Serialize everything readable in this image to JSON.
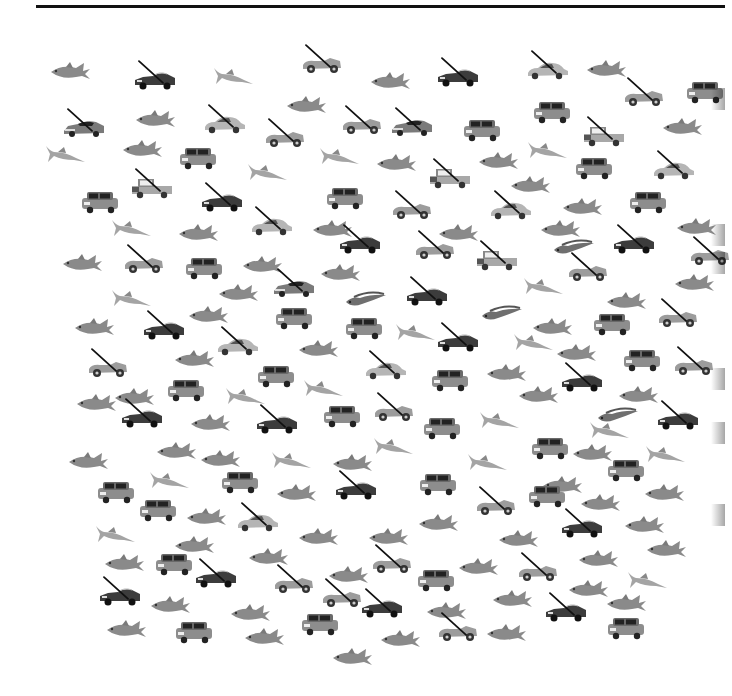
{
  "colors": {
    "rule": "#111111",
    "cross": "#111111",
    "fish": "#8a8a8a",
    "car_dark": "#3a3a3a",
    "car_light": "#9a9a9a"
  },
  "legend": {
    "target": "non-mini car (crossed)",
    "distractors": [
      "mini car",
      "fish"
    ]
  },
  "items": [
    {
      "t": "fish",
      "x": 48,
      "y": 60
    },
    {
      "t": "convertible",
      "x": 133,
      "y": 68,
      "c": 1
    },
    {
      "t": "marlin",
      "x": 210,
      "y": 64
    },
    {
      "t": "roadster",
      "x": 300,
      "y": 52,
      "c": 1
    },
    {
      "t": "fish",
      "x": 368,
      "y": 70
    },
    {
      "t": "convertible",
      "x": 436,
      "y": 65,
      "c": 1
    },
    {
      "t": "coupe",
      "x": 526,
      "y": 58,
      "c": 1
    },
    {
      "t": "fish",
      "x": 584,
      "y": 58
    },
    {
      "t": "roadster",
      "x": 622,
      "y": 85,
      "c": 1
    },
    {
      "t": "mini",
      "x": 683,
      "y": 80
    },
    {
      "t": "sportscar",
      "x": 62,
      "y": 116,
      "c": 1
    },
    {
      "t": "fish",
      "x": 133,
      "y": 108
    },
    {
      "t": "coupe",
      "x": 203,
      "y": 112,
      "c": 1
    },
    {
      "t": "roadster",
      "x": 263,
      "y": 126,
      "c": 1
    },
    {
      "t": "fish",
      "x": 284,
      "y": 94
    },
    {
      "t": "roadster",
      "x": 340,
      "y": 113,
      "c": 1
    },
    {
      "t": "sportscar",
      "x": 390,
      "y": 115,
      "c": 1
    },
    {
      "t": "mini",
      "x": 460,
      "y": 118
    },
    {
      "t": "mini",
      "x": 530,
      "y": 100
    },
    {
      "t": "pickup",
      "x": 582,
      "y": 124,
      "c": 1
    },
    {
      "t": "fish",
      "x": 660,
      "y": 116
    },
    {
      "t": "marlin",
      "x": 42,
      "y": 142
    },
    {
      "t": "fish",
      "x": 120,
      "y": 138
    },
    {
      "t": "mini",
      "x": 176,
      "y": 146
    },
    {
      "t": "marlin",
      "x": 316,
      "y": 144
    },
    {
      "t": "fish",
      "x": 374,
      "y": 152
    },
    {
      "t": "fish",
      "x": 476,
      "y": 150
    },
    {
      "t": "marlin",
      "x": 524,
      "y": 138
    },
    {
      "t": "mini",
      "x": 572,
      "y": 156
    },
    {
      "t": "coupe",
      "x": 652,
      "y": 158,
      "c": 1
    },
    {
      "t": "mini",
      "x": 78,
      "y": 190
    },
    {
      "t": "pickup",
      "x": 130,
      "y": 176,
      "c": 1
    },
    {
      "t": "convertible",
      "x": 200,
      "y": 190,
      "c": 1
    },
    {
      "t": "marlin",
      "x": 244,
      "y": 160
    },
    {
      "t": "mini",
      "x": 323,
      "y": 186
    },
    {
      "t": "roadster",
      "x": 390,
      "y": 198,
      "c": 1
    },
    {
      "t": "pickup",
      "x": 428,
      "y": 166,
      "c": 1
    },
    {
      "t": "fish",
      "x": 508,
      "y": 174
    },
    {
      "t": "coupe",
      "x": 489,
      "y": 198,
      "c": 1
    },
    {
      "t": "fish",
      "x": 560,
      "y": 196
    },
    {
      "t": "mini",
      "x": 626,
      "y": 190
    },
    {
      "t": "marlin",
      "x": 108,
      "y": 216
    },
    {
      "t": "fish",
      "x": 176,
      "y": 222
    },
    {
      "t": "coupe",
      "x": 250,
      "y": 214,
      "c": 1
    },
    {
      "t": "fish",
      "x": 310,
      "y": 218
    },
    {
      "t": "convertible",
      "x": 338,
      "y": 232,
      "c": 1
    },
    {
      "t": "roadster",
      "x": 413,
      "y": 238,
      "c": 1
    },
    {
      "t": "fish",
      "x": 436,
      "y": 222
    },
    {
      "t": "fish",
      "x": 538,
      "y": 218
    },
    {
      "t": "eelfish",
      "x": 552,
      "y": 236
    },
    {
      "t": "convertible",
      "x": 612,
      "y": 232,
      "c": 1
    },
    {
      "t": "fish",
      "x": 674,
      "y": 216
    },
    {
      "t": "roadster",
      "x": 688,
      "y": 244,
      "c": 1
    },
    {
      "t": "fish",
      "x": 60,
      "y": 252
    },
    {
      "t": "roadster",
      "x": 122,
      "y": 252,
      "c": 1
    },
    {
      "t": "mini",
      "x": 182,
      "y": 256
    },
    {
      "t": "fish",
      "x": 240,
      "y": 254
    },
    {
      "t": "sportscar",
      "x": 272,
      "y": 276,
      "c": 1
    },
    {
      "t": "fish",
      "x": 318,
      "y": 262
    },
    {
      "t": "pickup",
      "x": 475,
      "y": 248,
      "c": 1
    },
    {
      "t": "roadster",
      "x": 566,
      "y": 260,
      "c": 1
    },
    {
      "t": "fish",
      "x": 604,
      "y": 290
    },
    {
      "t": "fish",
      "x": 672,
      "y": 272
    },
    {
      "t": "marlin",
      "x": 108,
      "y": 286
    },
    {
      "t": "fish",
      "x": 216,
      "y": 282
    },
    {
      "t": "eelfish",
      "x": 344,
      "y": 288
    },
    {
      "t": "convertible",
      "x": 405,
      "y": 284,
      "c": 1
    },
    {
      "t": "eelfish",
      "x": 480,
      "y": 302
    },
    {
      "t": "marlin",
      "x": 520,
      "y": 274
    },
    {
      "t": "mini",
      "x": 272,
      "y": 306
    },
    {
      "t": "fish",
      "x": 186,
      "y": 304
    },
    {
      "t": "fish",
      "x": 72,
      "y": 316
    },
    {
      "t": "convertible",
      "x": 142,
      "y": 318,
      "c": 1
    },
    {
      "t": "coupe",
      "x": 216,
      "y": 334,
      "c": 1
    },
    {
      "t": "mini",
      "x": 342,
      "y": 316
    },
    {
      "t": "marlin",
      "x": 392,
      "y": 320
    },
    {
      "t": "convertible",
      "x": 436,
      "y": 330,
      "c": 1
    },
    {
      "t": "fish",
      "x": 530,
      "y": 316
    },
    {
      "t": "mini",
      "x": 590,
      "y": 312
    },
    {
      "t": "roadster",
      "x": 656,
      "y": 306,
      "c": 1
    },
    {
      "t": "fish",
      "x": 296,
      "y": 338
    },
    {
      "t": "fish",
      "x": 172,
      "y": 348
    },
    {
      "t": "fish",
      "x": 554,
      "y": 342
    },
    {
      "t": "marlin",
      "x": 510,
      "y": 330
    },
    {
      "t": "roadster",
      "x": 86,
      "y": 356,
      "c": 1
    },
    {
      "t": "mini",
      "x": 164,
      "y": 378
    },
    {
      "t": "mini",
      "x": 254,
      "y": 364
    },
    {
      "t": "coupe",
      "x": 364,
      "y": 358,
      "c": 1
    },
    {
      "t": "mini",
      "x": 428,
      "y": 368
    },
    {
      "t": "fish",
      "x": 484,
      "y": 362
    },
    {
      "t": "convertible",
      "x": 560,
      "y": 370,
      "c": 1
    },
    {
      "t": "mini",
      "x": 620,
      "y": 348
    },
    {
      "t": "roadster",
      "x": 672,
      "y": 354,
      "c": 1
    },
    {
      "t": "fish",
      "x": 74,
      "y": 392
    },
    {
      "t": "fish",
      "x": 112,
      "y": 386
    },
    {
      "t": "marlin",
      "x": 222,
      "y": 384
    },
    {
      "t": "marlin",
      "x": 300,
      "y": 376
    },
    {
      "t": "fish",
      "x": 516,
      "y": 384
    },
    {
      "t": "fish",
      "x": 616,
      "y": 384
    },
    {
      "t": "eelfish",
      "x": 596,
      "y": 404
    },
    {
      "t": "convertible",
      "x": 120,
      "y": 406,
      "c": 1
    },
    {
      "t": "fish",
      "x": 188,
      "y": 412
    },
    {
      "t": "convertible",
      "x": 255,
      "y": 412,
      "c": 1
    },
    {
      "t": "mini",
      "x": 320,
      "y": 404
    },
    {
      "t": "roadster",
      "x": 372,
      "y": 400,
      "c": 1
    },
    {
      "t": "mini",
      "x": 420,
      "y": 416
    },
    {
      "t": "marlin",
      "x": 476,
      "y": 408
    },
    {
      "t": "marlin",
      "x": 586,
      "y": 418
    },
    {
      "t": "convertible",
      "x": 656,
      "y": 408,
      "c": 1
    },
    {
      "t": "fish",
      "x": 154,
      "y": 440
    },
    {
      "t": "fish",
      "x": 198,
      "y": 448
    },
    {
      "t": "marlin",
      "x": 370,
      "y": 434
    },
    {
      "t": "mini",
      "x": 528,
      "y": 436
    },
    {
      "t": "fish",
      "x": 570,
      "y": 442
    },
    {
      "t": "marlin",
      "x": 642,
      "y": 442
    },
    {
      "t": "fish",
      "x": 66,
      "y": 450
    },
    {
      "t": "marlin",
      "x": 268,
      "y": 448
    },
    {
      "t": "fish",
      "x": 330,
      "y": 452
    },
    {
      "t": "marlin",
      "x": 464,
      "y": 450
    },
    {
      "t": "mini",
      "x": 604,
      "y": 458
    },
    {
      "t": "marlin",
      "x": 146,
      "y": 468
    },
    {
      "t": "mini",
      "x": 218,
      "y": 470
    },
    {
      "t": "convertible",
      "x": 334,
      "y": 478,
      "c": 1
    },
    {
      "t": "mini",
      "x": 416,
      "y": 472
    },
    {
      "t": "fish",
      "x": 274,
      "y": 482
    },
    {
      "t": "fish",
      "x": 540,
      "y": 474
    },
    {
      "t": "fish",
      "x": 642,
      "y": 482
    },
    {
      "t": "mini",
      "x": 94,
      "y": 480
    },
    {
      "t": "mini",
      "x": 136,
      "y": 498
    },
    {
      "t": "fish",
      "x": 184,
      "y": 506
    },
    {
      "t": "roadster",
      "x": 474,
      "y": 494,
      "c": 1
    },
    {
      "t": "mini",
      "x": 525,
      "y": 484
    },
    {
      "t": "fish",
      "x": 578,
      "y": 492
    },
    {
      "t": "coupe",
      "x": 236,
      "y": 510,
      "c": 1
    },
    {
      "t": "fish",
      "x": 296,
      "y": 526
    },
    {
      "t": "fish",
      "x": 366,
      "y": 526
    },
    {
      "t": "fish",
      "x": 416,
      "y": 512
    },
    {
      "t": "fish",
      "x": 496,
      "y": 528
    },
    {
      "t": "convertible",
      "x": 560,
      "y": 516,
      "c": 1
    },
    {
      "t": "fish",
      "x": 622,
      "y": 514
    },
    {
      "t": "fish",
      "x": 644,
      "y": 538
    },
    {
      "t": "marlin",
      "x": 92,
      "y": 522
    },
    {
      "t": "fish",
      "x": 172,
      "y": 534
    },
    {
      "t": "fish",
      "x": 246,
      "y": 546
    },
    {
      "t": "fish",
      "x": 102,
      "y": 552
    },
    {
      "t": "mini",
      "x": 152,
      "y": 552
    },
    {
      "t": "convertible",
      "x": 194,
      "y": 566,
      "c": 1
    },
    {
      "t": "roadster",
      "x": 272,
      "y": 572,
      "c": 1
    },
    {
      "t": "roadster",
      "x": 370,
      "y": 552,
      "c": 1
    },
    {
      "t": "fish",
      "x": 326,
      "y": 564
    },
    {
      "t": "mini",
      "x": 414,
      "y": 568
    },
    {
      "t": "fish",
      "x": 456,
      "y": 556
    },
    {
      "t": "roadster",
      "x": 516,
      "y": 560,
      "c": 1
    },
    {
      "t": "fish",
      "x": 576,
      "y": 548
    },
    {
      "t": "fish",
      "x": 566,
      "y": 578
    },
    {
      "t": "marlin",
      "x": 624,
      "y": 568
    },
    {
      "t": "convertible",
      "x": 98,
      "y": 584,
      "c": 1
    },
    {
      "t": "fish",
      "x": 148,
      "y": 594
    },
    {
      "t": "fish",
      "x": 228,
      "y": 602
    },
    {
      "t": "roadster",
      "x": 320,
      "y": 586,
      "c": 1
    },
    {
      "t": "convertible",
      "x": 360,
      "y": 596,
      "c": 1
    },
    {
      "t": "fish",
      "x": 424,
      "y": 600
    },
    {
      "t": "fish",
      "x": 490,
      "y": 588
    },
    {
      "t": "convertible",
      "x": 544,
      "y": 600,
      "c": 1
    },
    {
      "t": "fish",
      "x": 604,
      "y": 592
    },
    {
      "t": "fish",
      "x": 104,
      "y": 618
    },
    {
      "t": "mini",
      "x": 172,
      "y": 620
    },
    {
      "t": "fish",
      "x": 242,
      "y": 626
    },
    {
      "t": "mini",
      "x": 298,
      "y": 612
    },
    {
      "t": "fish",
      "x": 378,
      "y": 628
    },
    {
      "t": "roadster",
      "x": 436,
      "y": 620,
      "c": 1
    },
    {
      "t": "fish",
      "x": 484,
      "y": 622
    },
    {
      "t": "mini",
      "x": 604,
      "y": 616
    },
    {
      "t": "fish",
      "x": 330,
      "y": 646
    }
  ],
  "edge_shadows": [
    88,
    224,
    252,
    368,
    422,
    504
  ]
}
